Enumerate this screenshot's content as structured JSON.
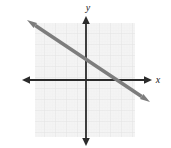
{
  "figure": {
    "name": "coordinate-plane-line-graph",
    "width": 171,
    "height": 148,
    "background_color": "#ffffff"
  },
  "axes": {
    "x_label": "x",
    "y_label": "y",
    "axis_color": "#2b2b2b",
    "origin_px": {
      "x": 86,
      "y": 80
    },
    "unit_px": 11,
    "x_axis": {
      "start_px": 22,
      "end_px": 152,
      "arrow_both_ends": true
    },
    "y_axis": {
      "start_px": 16,
      "end_px": 146,
      "arrow_both_ends": true
    }
  },
  "grid": {
    "color": "#e9e9e9",
    "fill": "#f4f4f4",
    "left_px": 35,
    "top_px": 23,
    "right_px": 135,
    "bottom_px": 137,
    "minor_spacing_px": 2.75,
    "major_spacing_px": 11,
    "visible": true
  },
  "chart_data": {
    "type": "line",
    "title": "",
    "xlabel": "x",
    "ylabel": "y",
    "grid": true,
    "legend": null,
    "xlim": [
      -6,
      6
    ],
    "ylim": [
      -5.5,
      6
    ],
    "series": [
      {
        "name": "line",
        "color": "#7d7d7d",
        "stroke_width_px": 3.5,
        "slope": -0.6666,
        "y_intercept": 2,
        "x_intercept": 3,
        "arrow_start": true,
        "arrow_end": true,
        "endpoints_px": [
          {
            "x": 27,
            "y": 20
          },
          {
            "x": 150,
            "y": 102
          }
        ],
        "points": [
          {
            "x": -5.4,
            "y": 5.6
          },
          {
            "x": 0,
            "y": 2
          },
          {
            "x": 3,
            "y": 0
          },
          {
            "x": 5.8,
            "y": -1.9
          }
        ]
      }
    ]
  }
}
